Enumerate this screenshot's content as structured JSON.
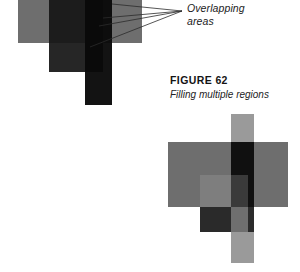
{
  "page": {
    "background_color": "#ffffff",
    "width": 300,
    "height": 272
  },
  "annotation": {
    "line1": "Overlapping",
    "line2": "areas",
    "style": "italic",
    "leader_lines": 4,
    "converge_point": {
      "x": 182,
      "y": 11
    }
  },
  "caption": {
    "title": "FIGURE 62",
    "subtitle": "Filling multiple regions"
  },
  "figures": {
    "top": {
      "name": "overlapping-regions-diagram",
      "shapes": [
        {
          "name": "horizontal-bar",
          "fill": "#6e6e6e",
          "x": 18,
          "y": -10,
          "w": 124,
          "h": 53
        },
        {
          "name": "square-region",
          "fill": "#262626",
          "x": 49,
          "y": -10,
          "w": 54,
          "h": 82
        },
        {
          "name": "vertical-bar",
          "fill": "#131313",
          "x": 85,
          "y": -10,
          "w": 27,
          "h": 115
        }
      ],
      "overlap_fills": [
        "#1c1c1c",
        "#0d0d0d",
        "#0a0a0a"
      ]
    },
    "bottom": {
      "name": "filling-multiple-regions-diagram",
      "shapes": [
        {
          "name": "vertical-bar",
          "fill": "#9a9a9a",
          "x": 231,
          "y": 114,
          "w": 23,
          "h": 149
        },
        {
          "name": "horizontal-bar",
          "fill": "#6e6e6e",
          "x": 168,
          "y": 142,
          "w": 120,
          "h": 65
        },
        {
          "name": "square-region",
          "fill": "#8f8f8f",
          "x": 200,
          "y": 175,
          "w": 48,
          "h": 57
        }
      ],
      "overlap_fills": [
        "#101010",
        "#7e7e7e",
        "#3a3a3a",
        "#2a2a2a",
        "#2b2b2b",
        "#6f6f6f"
      ]
    }
  }
}
